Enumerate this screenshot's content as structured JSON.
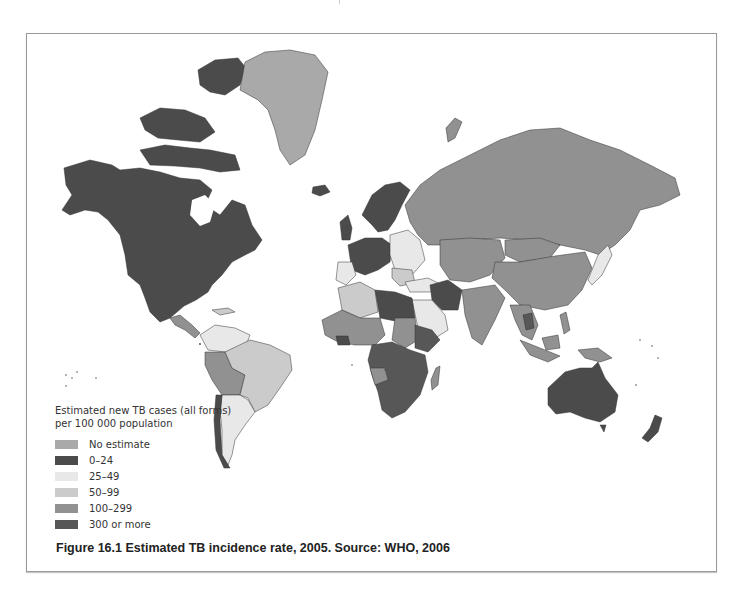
{
  "figure": {
    "caption": "Figure 16.1  Estimated TB incidence rate, 2005. Source: WHO, 2006"
  },
  "legend": {
    "title_line1": "Estimated new TB cases (all forms)",
    "title_line2": "per 100 000 population",
    "items": [
      {
        "label": "No estimate",
        "color": "#a9a9a9"
      },
      {
        "label": "0–24",
        "color": "#4b4b4b"
      },
      {
        "label": "25–49",
        "color": "#e8e8e8"
      },
      {
        "label": "50–99",
        "color": "#cbcbcb"
      },
      {
        "label": "100–299",
        "color": "#919191"
      },
      {
        "label": "300 or more",
        "color": "#575757"
      }
    ]
  },
  "map": {
    "type": "choropleth",
    "projection": "world",
    "regions": [
      {
        "name": "North America (Canada, USA, Mexico)",
        "category": "0–24"
      },
      {
        "name": "Greenland",
        "category": "No estimate"
      },
      {
        "name": "Western Europe",
        "category": "0–24"
      },
      {
        "name": "Eastern Europe",
        "category": "25–49"
      },
      {
        "name": "Russia",
        "category": "100–299"
      },
      {
        "name": "Central Asia",
        "category": "100–299"
      },
      {
        "name": "China",
        "category": "100–299"
      },
      {
        "name": "India",
        "category": "100–299"
      },
      {
        "name": "Iran",
        "category": "0–24"
      },
      {
        "name": "Arabian Peninsula",
        "category": "25–49"
      },
      {
        "name": "North Africa (Egypt, Libya)",
        "category": "0–24"
      },
      {
        "name": "Algeria/Morocco",
        "category": "50–99"
      },
      {
        "name": "West Africa",
        "category": "100–299"
      },
      {
        "name": "Southern & Central Africa",
        "category": "300 or more"
      },
      {
        "name": "Angola",
        "category": "100–299"
      },
      {
        "name": "Madagascar",
        "category": "100–299"
      },
      {
        "name": "Brazil",
        "category": "50–99"
      },
      {
        "name": "Argentina",
        "category": "25–49"
      },
      {
        "name": "Chile",
        "category": "0–24"
      },
      {
        "name": "Peru/Bolivia",
        "category": "100–299"
      },
      {
        "name": "Southeast Asia",
        "category": "100–299"
      },
      {
        "name": "Japan",
        "category": "25–49"
      },
      {
        "name": "Australia",
        "category": "0–24"
      },
      {
        "name": "New Zealand",
        "category": "0–24"
      }
    ]
  }
}
